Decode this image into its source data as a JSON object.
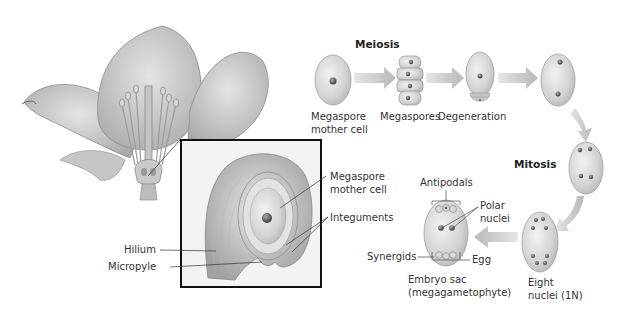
{
  "diagram": {
    "title_meiosis": "Meiosis",
    "title_mitosis": "Mitosis",
    "stages": [
      {
        "id": "megaspore-mother-cell",
        "label_line1": "Megaspore",
        "label_line2": "mother cell"
      },
      {
        "id": "megaspores",
        "label_line1": "Megaspores"
      },
      {
        "id": "degeneration",
        "label_line1": "Degeneration"
      },
      {
        "id": "two-nuclei",
        "label_line1": ""
      },
      {
        "id": "four-nuclei",
        "label_line1": ""
      },
      {
        "id": "eight-nuclei",
        "label_line1": "Eight",
        "label_line2": "nuclei (1N)"
      },
      {
        "id": "embryo-sac",
        "label_line1": "Embryo sac",
        "label_line2": "(megagametophyte)"
      }
    ],
    "embryo_sac_parts": {
      "antipodals": "Antipodals",
      "polar_line1": "Polar",
      "polar_line2": "nuclei",
      "synergids": "Synergids",
      "egg": "Egg"
    },
    "ovule_inset": {
      "megaspore_line1": "Megaspore",
      "megaspore_line2": "mother cell",
      "integuments": "Integuments",
      "hilium": "Hilium",
      "micropyle": "Micropyle"
    },
    "colors": {
      "cell_fill": "#d4d4d4",
      "cell_stroke": "#9a9a9a",
      "arrow": "#c8c8c8",
      "nucleus": "#6a6a6a",
      "inset_border": "#111111"
    }
  }
}
